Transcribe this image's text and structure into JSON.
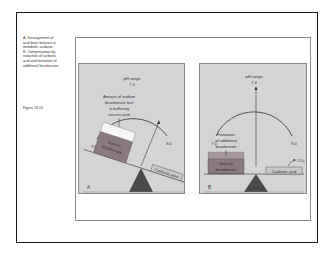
{
  "caption": {
    "lines": [
      "A. Derangement of",
      "acid-base balance in",
      "metabolic acidosis.",
      "B. Compensation by",
      "reduction of carbonic",
      "acid and formation of",
      "additional bicarbonate."
    ],
    "figure_number": "Figure 24.05"
  },
  "panel_a": {
    "label": "A",
    "scale_title": "pH range",
    "scale_center": "7.4",
    "scale_left": "7.0",
    "scale_right": "8.0",
    "annotation": [
      "Amount of sodium",
      "bicarbonate lost",
      "in buffering",
      "excess acid"
    ],
    "left_block": [
      "Sodium",
      "bicarbonate"
    ],
    "right_block": "Carbonic acid"
  },
  "panel_b": {
    "label": "B",
    "scale_title": "pH range",
    "scale_center": "7.4",
    "scale_left": "7.0",
    "scale_right": "8.0",
    "annotation": [
      "Formation",
      "of additional",
      "bicarbonate"
    ],
    "left_block": [
      "Sodium",
      "bicarbonate"
    ],
    "right_block": "Carbonic acid",
    "gas_label": "CO",
    "gas_sub": "2"
  },
  "colors": {
    "panel_bg": "#d4d4d4",
    "block_fill": "#8a7a7e",
    "fulcrum": "#4a4a4a",
    "carbonic_fill": "#c8c8c8"
  }
}
